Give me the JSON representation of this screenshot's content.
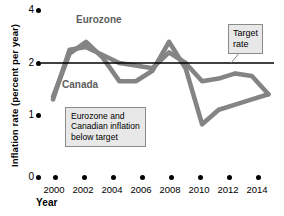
{
  "chart_data": {
    "type": "line",
    "title": "",
    "xlabel": "Year",
    "ylabel": "Inflation rate (percent per year)",
    "xlim": [
      1999.5,
      2014.5
    ],
    "ylim": [
      0,
      4
    ],
    "grid": false,
    "legend_position": "inline-labels",
    "x_tick_labels": [
      "2000",
      "2002",
      "2004",
      "2006",
      "2008",
      "2010",
      "2012",
      "2014"
    ],
    "x_ticks": [
      2000,
      2002,
      2004,
      2006,
      2008,
      2010,
      2012,
      2014
    ],
    "y_tick_labels": [
      "0",
      "1",
      "2",
      "4"
    ],
    "y_ticks": [
      0,
      1,
      2,
      4
    ],
    "y_axis_note": "compressed upper range: spacing 1-to-2 equals spacing 2-to-4",
    "line_color": "#848484",
    "target_line_color": "#000000",
    "series": [
      {
        "name": "Eurozone",
        "color": "#848484",
        "x": [
          2000,
          2001,
          2002,
          2003,
          2004,
          2005,
          2006,
          2007,
          2008,
          2009,
          2010,
          2011,
          2012,
          2013
        ],
        "values": [
          1.3,
          2.5,
          2.6,
          2.3,
          2.0,
          1.95,
          1.9,
          2.4,
          2.0,
          1.65,
          1.7,
          1.8,
          1.75,
          1.4
        ]
      },
      {
        "name": "Canada",
        "color": "#848484",
        "x": [
          2000,
          2001,
          2002,
          2003,
          2004,
          2005,
          2006,
          2007,
          2008,
          2009,
          2010,
          2011,
          2012,
          2013
        ],
        "values": [
          1.35,
          2.35,
          2.8,
          2.2,
          1.65,
          1.65,
          1.85,
          2.8,
          1.9,
          0.85,
          1.1,
          1.2,
          1.3,
          1.4
        ]
      }
    ],
    "target_line": {
      "label": "Target rate",
      "value": 2.0
    },
    "annotations": [
      {
        "name": "target-rate-callout",
        "text_lines": [
          "Target",
          "rate"
        ],
        "text": "Target rate"
      },
      {
        "name": "below-target-callout",
        "text_lines": [
          "Eurozone and",
          "Canadian inflation",
          "below target"
        ],
        "text": "Eurozone and Canadian inflation below target"
      }
    ],
    "series_labels": [
      {
        "name": "eurozone-label",
        "text": "Eurozone"
      },
      {
        "name": "canada-label",
        "text": "Canada"
      }
    ]
  }
}
